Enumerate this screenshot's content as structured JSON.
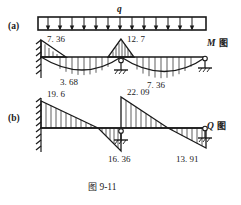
{
  "figure": {
    "caption_cjk": "图",
    "caption_number": "9-11"
  },
  "panels": [
    {
      "tag": "(a)",
      "diagram_symbol": "M",
      "diagram_cjk": "图",
      "load_label": "q"
    },
    {
      "tag": "(b)",
      "diagram_symbol": "Q",
      "diagram_cjk": "图"
    }
  ],
  "moment_diagram": {
    "labels": {
      "support_left": "7. 36",
      "support_middle": "12. 7",
      "span_left": "3. 68",
      "span_right": "7. 36"
    }
  },
  "shear_diagram": {
    "labels": {
      "left_top": "19. 6",
      "middle_top": "22. 09",
      "middle_bottom": "16. 36",
      "right_bottom": "13. 91"
    }
  },
  "colors": {
    "ink": "#1a1a1a",
    "paper": "#ffffff"
  }
}
